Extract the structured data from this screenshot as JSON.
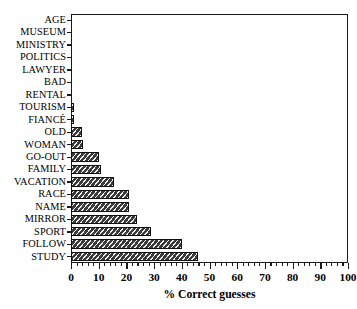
{
  "chart_data": {
    "type": "bar",
    "orientation": "horizontal",
    "title": "",
    "xlabel": "% Correct guesses",
    "ylabel": "",
    "xlim": [
      0,
      100
    ],
    "ylim": null,
    "grid": false,
    "legend": null,
    "xticks": [
      0,
      10,
      20,
      30,
      40,
      50,
      60,
      70,
      80,
      90,
      100
    ],
    "xticklabels": [
      "0",
      "10",
      "20",
      "30",
      "40",
      "50",
      "60",
      "70",
      "80",
      "90",
      "100"
    ],
    "minor_tick_interval": 2,
    "categories": [
      "AGE",
      "MUSEUM",
      "MINISTRY",
      "POLITICS",
      "LAWYER",
      "BAD",
      "RENTAL",
      "TOURISM",
      "FIANCÉ",
      "OLD",
      "WOMAN",
      "GO-OUT",
      "FAMILY",
      "VACATION",
      "RACE",
      "NAME",
      "MIRROR",
      "SPORT",
      "FOLLOW",
      "STUDY"
    ],
    "values": [
      0,
      0,
      0,
      0,
      0,
      0,
      0,
      1,
      1,
      4,
      4.5,
      10,
      11,
      15.5,
      21,
      21,
      24,
      29,
      40,
      46
    ],
    "bar_color": "#3a3a3a",
    "bar_edge_color": "#101010",
    "bar_hatch": "diagonal-stripe"
  }
}
